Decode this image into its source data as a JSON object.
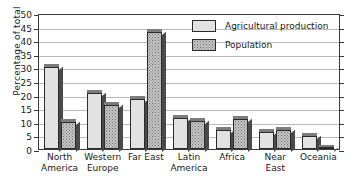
{
  "chart_data": {
    "type": "bar",
    "title": "",
    "xlabel": "",
    "ylabel": "Percentage of total",
    "ylim": [
      0,
      50
    ],
    "ytick_step": 5,
    "yticks": [
      0,
      5,
      10,
      15,
      20,
      25,
      30,
      35,
      40,
      45,
      50
    ],
    "grid": true,
    "legend_position": "top-right",
    "categories": [
      "North America",
      "Western Europe",
      "Far East",
      "Latin America",
      "Africa",
      "Near East",
      "Oceania"
    ],
    "category_lines": [
      [
        "North",
        "America"
      ],
      [
        "Western",
        "Europe"
      ],
      [
        "Far East",
        ""
      ],
      [
        "Latin",
        "America"
      ],
      [
        "Africa",
        ""
      ],
      [
        "Near",
        "East"
      ],
      [
        "Oceania",
        ""
      ]
    ],
    "series": [
      {
        "name": "Agricultural production",
        "fill": "solid-light-gray",
        "color": "#e2e2e2",
        "values": [
          30.5,
          21,
          18.7,
          11.5,
          7,
          6.5,
          5
        ]
      },
      {
        "name": "Population",
        "fill": "dotted-gray",
        "color": "#c8c8c8",
        "values": [
          10,
          16.5,
          43.5,
          10.3,
          11.3,
          7,
          0.5
        ]
      }
    ]
  },
  "legend": {
    "items": [
      {
        "label": "Agricultural production"
      },
      {
        "label": "Population"
      }
    ]
  },
  "axis": {
    "y_title": "Percentage of total"
  }
}
